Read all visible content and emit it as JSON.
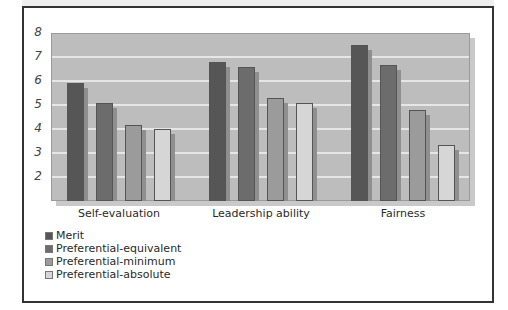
{
  "chart_data": {
    "type": "bar",
    "title": "",
    "xlabel": "",
    "ylabel": "",
    "categories": [
      "Self-evaluation",
      "Leadership ability",
      "Fairness"
    ],
    "series": [
      {
        "name": "Merit",
        "color": "#565656",
        "values": [
          5.9,
          6.8,
          7.5
        ]
      },
      {
        "name": "Preferential-equivalent",
        "color": "#6c6c6c",
        "values": [
          5.1,
          6.6,
          6.65
        ]
      },
      {
        "name": "Preferential-minimum",
        "color": "#9b9b9b",
        "values": [
          4.15,
          5.3,
          4.8
        ]
      },
      {
        "name": "Preferential-absolute",
        "color": "#d6d6d6",
        "values": [
          4.0,
          5.1,
          3.35
        ]
      }
    ],
    "yticks": [
      "8",
      "7",
      "6",
      "5",
      "4",
      "3",
      "2"
    ],
    "ylim": [
      1,
      8
    ],
    "grid": true,
    "legend_position": "bottom-left"
  },
  "style": {
    "plot_bg": "#bdbdbd",
    "gridline": "#e6e6e6",
    "frame_border": "#333333"
  }
}
